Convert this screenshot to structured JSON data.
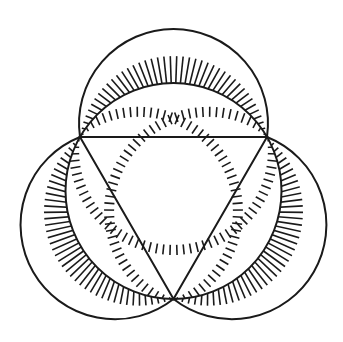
{
  "figure": {
    "stroke_color": "#1a1a1a",
    "background": "#ffffff",
    "stroke_width": 2,
    "hatch_width": 1.6,
    "triangle": {
      "A": [
        80,
        137
      ],
      "B": [
        267,
        137
      ],
      "C": [
        173.5,
        299
      ]
    },
    "circumcircle": {
      "cx": 173.5,
      "cy": 191,
      "r": 108
    },
    "lunes": [
      {
        "name": "top",
        "edge": [
          "A",
          "B"
        ],
        "hatch_count": 46
      },
      {
        "name": "left",
        "edge": [
          "C",
          "A"
        ],
        "hatch_count": 46
      },
      {
        "name": "right",
        "edge": [
          "B",
          "C"
        ],
        "hatch_count": 46
      }
    ],
    "outer_bulge": 13.5
  }
}
